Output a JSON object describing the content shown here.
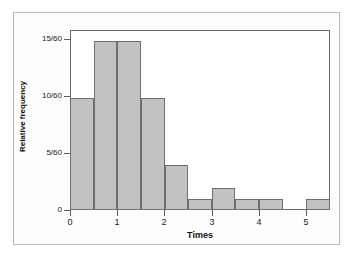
{
  "chart_data": {
    "type": "bar",
    "title": "",
    "subtitle": "",
    "xlabel": "Times",
    "ylabel": "Relative frequency",
    "grid": false,
    "legend": null,
    "bin_width": 0.5,
    "xlim": [
      0,
      5.5
    ],
    "ylim": [
      0,
      16
    ],
    "x_tick_labels": [
      "0",
      "1",
      "2",
      "3",
      "4",
      "5"
    ],
    "x_tick_values": [
      0,
      1,
      2,
      3,
      4,
      5
    ],
    "y_tick_labels": [
      "0",
      "5/60",
      "10/60",
      "15/60"
    ],
    "y_tick_values": [
      0,
      5,
      10,
      15
    ],
    "y_units": "counts out of 60",
    "bins": [
      {
        "label": "0.0-0.5",
        "start": 0.0,
        "end": 0.5,
        "value": 10,
        "display": "10/60"
      },
      {
        "label": "0.5-1.0",
        "start": 0.5,
        "end": 1.0,
        "value": 15,
        "display": "15/60"
      },
      {
        "label": "1.0-1.5",
        "start": 1.0,
        "end": 1.5,
        "value": 15,
        "display": "15/60"
      },
      {
        "label": "1.5-2.0",
        "start": 1.5,
        "end": 2.0,
        "value": 10,
        "display": "10/60"
      },
      {
        "label": "2.0-2.5",
        "start": 2.0,
        "end": 2.5,
        "value": 4,
        "display": "4/60"
      },
      {
        "label": "2.5-3.0",
        "start": 2.5,
        "end": 3.0,
        "value": 1,
        "display": "1/60"
      },
      {
        "label": "3.0-3.5",
        "start": 3.0,
        "end": 3.5,
        "value": 2,
        "display": "2/60"
      },
      {
        "label": "3.5-4.0",
        "start": 3.5,
        "end": 4.0,
        "value": 1,
        "display": "1/60"
      },
      {
        "label": "4.0-4.5",
        "start": 4.0,
        "end": 4.5,
        "value": 1,
        "display": "1/60"
      },
      {
        "label": "4.5-5.0",
        "start": 4.5,
        "end": 5.0,
        "value": 0,
        "display": "0"
      },
      {
        "label": "5.0-5.5",
        "start": 5.0,
        "end": 5.5,
        "value": 1,
        "display": "1/60"
      }
    ],
    "categories": [
      "0.0-0.5",
      "0.5-1.0",
      "1.0-1.5",
      "1.5-2.0",
      "2.0-2.5",
      "2.5-3.0",
      "3.0-3.5",
      "3.5-4.0",
      "4.0-4.5",
      "4.5-5.0",
      "5.0-5.5"
    ],
    "values": [
      10,
      15,
      15,
      10,
      4,
      1,
      2,
      1,
      1,
      0,
      1
    ],
    "colors": {
      "bar_fill": "#c2c2c2",
      "bar_edge": "#6f6f6f",
      "axis": "#6b6b6b",
      "outer_frame": "#b9b9b9",
      "text": "#1a1a1a",
      "background": "#ffffff"
    }
  }
}
